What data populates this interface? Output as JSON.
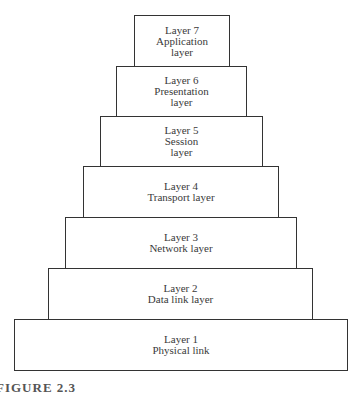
{
  "diagram": {
    "layers": [
      {
        "id": 7,
        "lines": [
          "Layer 7",
          "Application",
          "layer"
        ],
        "box": [
          134,
          15,
          96,
          52
        ]
      },
      {
        "id": 6,
        "lines": [
          "Layer 6",
          "Presentation",
          "layer"
        ],
        "box": [
          116,
          66,
          131,
          51
        ]
      },
      {
        "id": 5,
        "lines": [
          "Layer 5",
          "Session",
          "layer"
        ],
        "box": [
          100,
          116,
          163,
          51
        ]
      },
      {
        "id": 4,
        "lines": [
          "Layer 4",
          "Transport layer"
        ],
        "box": [
          83,
          166,
          196,
          52
        ]
      },
      {
        "id": 3,
        "lines": [
          "Layer 3",
          "Network layer"
        ],
        "box": [
          65,
          217,
          232,
          52
        ]
      },
      {
        "id": 2,
        "lines": [
          "Layer 2",
          "Data link layer"
        ],
        "box": [
          48,
          268,
          265,
          52
        ]
      },
      {
        "id": 1,
        "lines": [
          "Layer 1",
          "Physical link"
        ],
        "box": [
          14,
          319,
          334,
          52
        ]
      }
    ],
    "caption": "FIGURE 2.3"
  }
}
